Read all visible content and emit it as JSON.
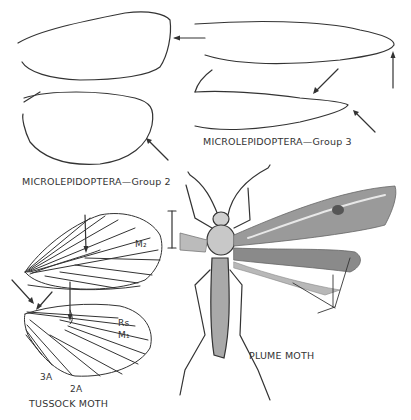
{
  "figure": {
    "panels": [
      {
        "id": "microlepidoptera-group-2",
        "caption": "MICROLEPIDOPTERA—Group 2",
        "parts": [
          "forewing outline",
          "hindwing outline"
        ],
        "arrows": 2
      },
      {
        "id": "microlepidoptera-group-3",
        "caption": "MICROLEPIDOPTERA—Group 3",
        "parts": [
          "forewing outline",
          "hindwing outline"
        ],
        "arrows": 3
      },
      {
        "id": "tussock-moth",
        "caption": "TUSSOCK MOTH",
        "vein_labels": {
          "m2": "M₂",
          "rs": "Rs",
          "m1": "M₁",
          "a3": "3A",
          "a2": "2A"
        },
        "arrows": 4
      },
      {
        "id": "plume-moth",
        "caption": "PLUME MOTH",
        "parts": [
          "body",
          "antennae",
          "legs",
          "right wings",
          "scale bar"
        ],
        "pointer_lines": 3
      }
    ],
    "colors": {
      "ink": "#333333",
      "background": "#ffffff"
    }
  }
}
